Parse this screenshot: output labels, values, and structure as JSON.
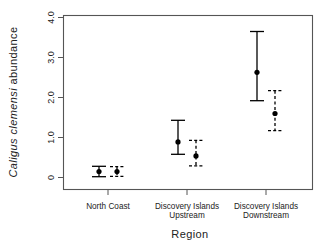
{
  "chart_data": {
    "type": "scatter",
    "title": "",
    "subtitle": "",
    "xlabel": "Region",
    "ylabel": "Caligus clemensi abundance",
    "ylabel_style": "italic-genus-species",
    "categories": [
      "North Coast",
      "Discovery Islands Upstream",
      "Discovery Islands Downstream"
    ],
    "category_labels_wrapped": [
      [
        "North Coast",
        ""
      ],
      [
        "Discovery Islands",
        "Upstream"
      ],
      [
        "Discovery Islands",
        "Downstream"
      ]
    ],
    "ylim": [
      0,
      4.15
    ],
    "ytick_labels": [
      "0",
      "1.0",
      "2.0",
      "3.0",
      "4.0"
    ],
    "ytick_values": [
      0,
      1.0,
      2.0,
      3.0,
      4.0
    ],
    "grid": false,
    "legend": "none",
    "error_bar_type": "confidence interval",
    "series": [
      {
        "name": "solid",
        "linestyle": "solid",
        "marker": "filled-circle",
        "color": "#000000",
        "values": [
          0.15,
          0.89,
          2.63
        ],
        "ci_lower": [
          0.02,
          0.58,
          1.92
        ],
        "ci_upper": [
          0.28,
          1.43,
          3.65
        ]
      },
      {
        "name": "dashed",
        "linestyle": "dashed",
        "marker": "filled-circle",
        "color": "#000000",
        "values": [
          0.15,
          0.54,
          1.6
        ],
        "ci_lower": [
          0.03,
          0.29,
          1.17
        ],
        "ci_upper": [
          0.27,
          0.93,
          2.17
        ]
      }
    ]
  },
  "axes": {
    "y_title": "Caligus clemensi abundance",
    "y_title_italic_part": "Caligus clemensi",
    "y_title_roman_part": "abundance",
    "x_title": "Region",
    "ytick_0": "0",
    "ytick_1": "1.0",
    "ytick_2": "2.0",
    "ytick_3": "3.0",
    "ytick_4": "4.0"
  },
  "categories": {
    "c0_line1": "North Coast",
    "c0_line2": "",
    "c1_line1": "Discovery Islands",
    "c1_line2": "Upstream",
    "c2_line1": "Discovery Islands",
    "c2_line2": "Downstream"
  },
  "colors": {
    "marker": "#000000",
    "frame": "#555555",
    "background": "#ffffff",
    "text": "#222222"
  }
}
